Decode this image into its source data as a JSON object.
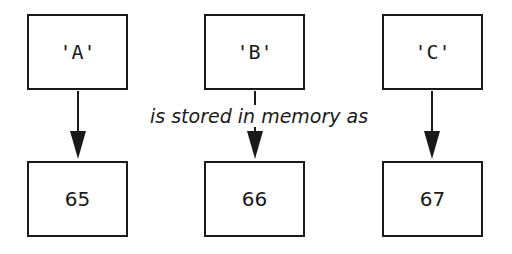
{
  "diagram": {
    "label": "is stored in memory as",
    "columns": [
      {
        "character": "'A'",
        "code": "65"
      },
      {
        "character": "'B'",
        "code": "66"
      },
      {
        "character": "'C'",
        "code": "67"
      }
    ]
  }
}
